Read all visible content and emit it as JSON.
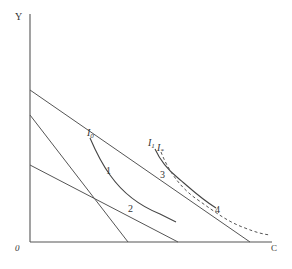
{
  "figure": {
    "axes": {
      "y_label": "Y",
      "x_label": "C",
      "origin_label": "0"
    },
    "curves": {
      "i0": {
        "label": "I",
        "sub": "0"
      },
      "i1": {
        "label": "I",
        "sub": "1"
      },
      "istar": {
        "label": "I",
        "sub": "*"
      }
    },
    "points": [
      "1",
      "2",
      "3",
      "4"
    ],
    "colors": {
      "line": "#555555",
      "text": "#333333",
      "background": "#ffffff"
    }
  }
}
